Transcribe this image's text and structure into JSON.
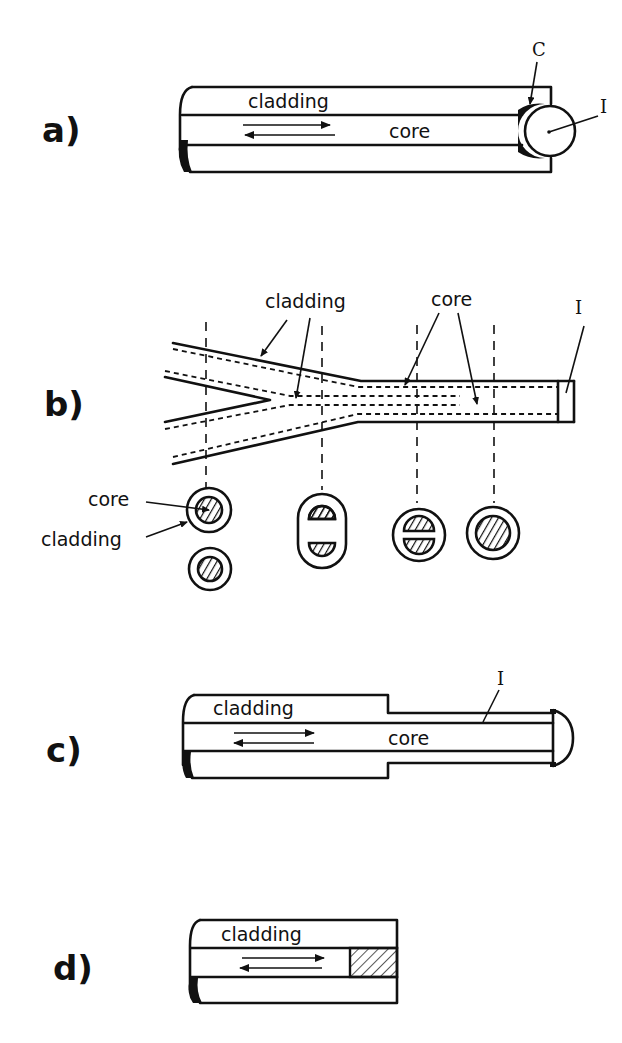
{
  "figure": {
    "panels": [
      {
        "id": "a",
        "label": "a)",
        "labels": {
          "cladding": "cladding",
          "core": "core",
          "coupling": "C",
          "interface": "I"
        },
        "description": "Fiber end with coupling medium C and spherical interface I"
      },
      {
        "id": "b",
        "label": "b)",
        "labels": {
          "cladding": "cladding",
          "core": "core",
          "interface": "I",
          "section_core": "core",
          "section_cladding": "cladding"
        },
        "description": "Two fibers merging into one with cross-sections"
      },
      {
        "id": "c",
        "label": "c)",
        "labels": {
          "cladding": "cladding",
          "core": "core",
          "interface": "I"
        },
        "description": "Stripped fiber end with domed interface I"
      },
      {
        "id": "d",
        "label": "d)",
        "labels": {
          "cladding": "cladding"
        },
        "description": "Fiber with hatched end element in core"
      }
    ],
    "colors": {
      "ink": "#111111",
      "background": "#ffffff"
    }
  }
}
